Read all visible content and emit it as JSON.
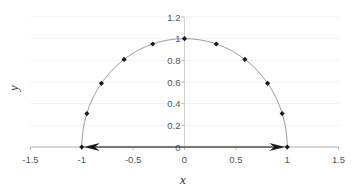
{
  "chart_data": {
    "type": "scatter",
    "title": "",
    "xlabel": "x",
    "ylabel": "y",
    "xlim": [
      -1.5,
      1.5
    ],
    "ylim": [
      0,
      1.2
    ],
    "x_ticks": [
      "-1.5",
      "-1",
      "-0.5",
      "0",
      "0.5",
      "1",
      "1.5"
    ],
    "y_ticks": [
      "0",
      "0.2",
      "0.4",
      "0.6",
      "0.8",
      "1",
      "1.2"
    ],
    "grid": "horizontal",
    "legend": null,
    "series": [
      {
        "name": "unit semicircle curve",
        "style": "line",
        "color": "#8c8c8c",
        "description": "y = sqrt(1 - x^2), x from -1 to 1"
      },
      {
        "name": "points",
        "style": "markers",
        "color": "#1a1a1a",
        "x": [
          1.0,
          0.951,
          0.809,
          0.588,
          0.309,
          0.0,
          -0.309,
          -0.588,
          -0.809,
          -0.951,
          -1.0
        ],
        "y": [
          0.0,
          0.309,
          0.588,
          0.809,
          0.951,
          1.0,
          0.951,
          0.809,
          0.588,
          0.309,
          0.0
        ]
      }
    ],
    "annotations": [
      {
        "type": "arrow",
        "from": [
          0,
          0
        ],
        "to": [
          1,
          0
        ],
        "color": "#1a1a1a"
      },
      {
        "type": "arrow",
        "from": [
          0,
          0
        ],
        "to": [
          -1,
          0
        ],
        "color": "#1a1a1a"
      }
    ]
  },
  "labels": {
    "xlabel": "x",
    "ylabel": "y",
    "xticks": [
      "-1.5",
      "-1",
      "-0.5",
      "0",
      "0.5",
      "1",
      "1.5"
    ],
    "yticks": [
      "0",
      "0.2",
      "0.4",
      "0.6",
      "0.8",
      "1",
      "1.2"
    ]
  }
}
